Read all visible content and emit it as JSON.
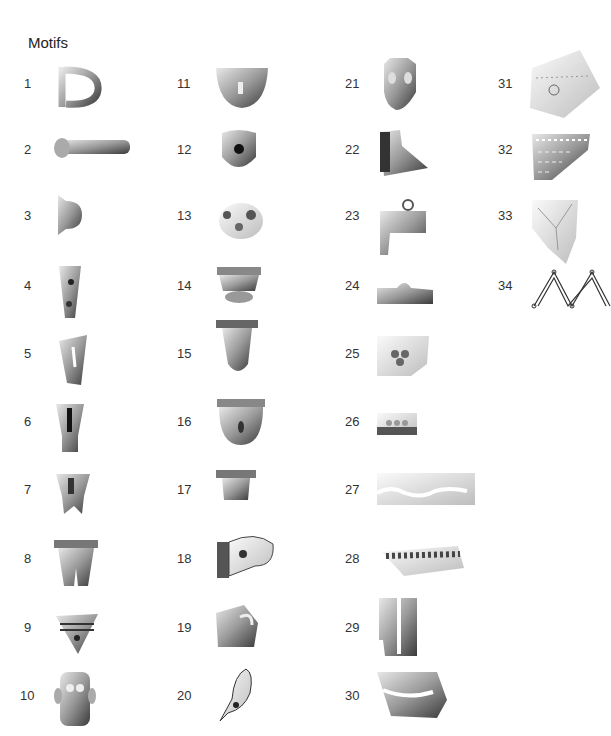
{
  "figure": {
    "title": "Motifs",
    "items": [
      {
        "n": "1",
        "x": 24,
        "y": 84,
        "ax": 52,
        "ay": 62,
        "aw": 50,
        "ah": 50,
        "shape": "handle-loop"
      },
      {
        "n": "2",
        "x": 24,
        "y": 150,
        "ax": 52,
        "ay": 134,
        "aw": 82,
        "ah": 28,
        "shape": "horizontal-bar"
      },
      {
        "n": "3",
        "x": 24,
        "y": 216,
        "ax": 52,
        "ay": 191,
        "aw": 32,
        "ah": 46,
        "shape": "knob"
      },
      {
        "n": "4",
        "x": 24,
        "y": 286,
        "ax": 55,
        "ay": 262,
        "aw": 30,
        "ah": 60,
        "shape": "tapered-leg"
      },
      {
        "n": "5",
        "x": 24,
        "y": 354,
        "ax": 55,
        "ay": 333,
        "aw": 34,
        "ah": 54,
        "shape": "tapered-leg-slit"
      },
      {
        "n": "6",
        "x": 24,
        "y": 422,
        "ax": 52,
        "ay": 400,
        "aw": 36,
        "ah": 55,
        "shape": "leg-groove"
      },
      {
        "n": "7",
        "x": 24,
        "y": 490,
        "ax": 52,
        "ay": 470,
        "aw": 42,
        "ah": 46,
        "shape": "molar-foot"
      },
      {
        "n": "8",
        "x": 24,
        "y": 559,
        "ax": 52,
        "ay": 538,
        "aw": 48,
        "ah": 52,
        "shape": "double-foot"
      },
      {
        "n": "9",
        "x": 24,
        "y": 628,
        "ax": 52,
        "ay": 608,
        "aw": 50,
        "ah": 50,
        "shape": "triangle-face"
      },
      {
        "n": "10",
        "x": 20,
        "y": 696,
        "ax": 52,
        "ay": 668,
        "aw": 46,
        "ah": 62,
        "shape": "mask-face"
      },
      {
        "n": "11",
        "x": 177,
        "y": 84,
        "ax": 214,
        "ay": 64,
        "aw": 56,
        "ah": 46,
        "shape": "bowl-face"
      },
      {
        "n": "12",
        "x": 177,
        "y": 150,
        "ax": 218,
        "ay": 127,
        "aw": 42,
        "ah": 46,
        "shape": "round-face-hole"
      },
      {
        "n": "13",
        "x": 177,
        "y": 216,
        "ax": 215,
        "ay": 197,
        "aw": 52,
        "ah": 44,
        "shape": "round-face-eyes"
      },
      {
        "n": "14",
        "x": 177,
        "y": 286,
        "ax": 215,
        "ay": 265,
        "aw": 48,
        "ah": 40,
        "shape": "cup-face"
      },
      {
        "n": "15",
        "x": 177,
        "y": 354,
        "ax": 216,
        "ay": 320,
        "aw": 42,
        "ah": 56,
        "shape": "tapered-pod"
      },
      {
        "n": "16",
        "x": 177,
        "y": 422,
        "ax": 215,
        "ay": 399,
        "aw": 52,
        "ah": 46,
        "shape": "bowl-hole"
      },
      {
        "n": "17",
        "x": 177,
        "y": 490,
        "ax": 216,
        "ay": 470,
        "aw": 40,
        "ah": 34,
        "shape": "small-cup"
      },
      {
        "n": "18",
        "x": 177,
        "y": 559,
        "ax": 215,
        "ay": 532,
        "aw": 62,
        "ah": 48,
        "shape": "animal-head"
      },
      {
        "n": "19",
        "x": 177,
        "y": 628,
        "ax": 214,
        "ay": 603,
        "aw": 46,
        "ah": 46,
        "shape": "fragment-loop"
      },
      {
        "n": "20",
        "x": 177,
        "y": 696,
        "ax": 214,
        "ay": 665,
        "aw": 40,
        "ah": 58,
        "shape": "bird-head"
      },
      {
        "n": "21",
        "x": 345,
        "y": 84,
        "ax": 376,
        "ay": 56,
        "aw": 46,
        "ah": 56,
        "shape": "animal-face"
      },
      {
        "n": "22",
        "x": 345,
        "y": 150,
        "ax": 376,
        "ay": 128,
        "aw": 52,
        "ah": 50,
        "shape": "beak-head"
      },
      {
        "n": "23",
        "x": 345,
        "y": 216,
        "ax": 376,
        "ay": 197,
        "aw": 52,
        "ah": 60,
        "shape": "jar-handle"
      },
      {
        "n": "24",
        "x": 345,
        "y": 286,
        "ax": 377,
        "ay": 278,
        "aw": 56,
        "ah": 26,
        "shape": "rim-knob"
      },
      {
        "n": "25",
        "x": 345,
        "y": 354,
        "ax": 377,
        "ay": 336,
        "aw": 52,
        "ah": 40,
        "shape": "rim-triple-dot"
      },
      {
        "n": "26",
        "x": 345,
        "y": 422,
        "ax": 377,
        "ay": 413,
        "aw": 40,
        "ah": 22,
        "shape": "rim-dots"
      },
      {
        "n": "27",
        "x": 345,
        "y": 490,
        "ax": 377,
        "ay": 473,
        "aw": 98,
        "ah": 32,
        "shape": "wavy-band"
      },
      {
        "n": "28",
        "x": 345,
        "y": 559,
        "ax": 380,
        "ay": 542,
        "aw": 84,
        "ah": 34,
        "shape": "rope-band"
      },
      {
        "n": "29",
        "x": 345,
        "y": 628,
        "ax": 377,
        "ay": 596,
        "aw": 42,
        "ah": 60,
        "shape": "vertical-ridge"
      },
      {
        "n": "30",
        "x": 345,
        "y": 696,
        "ax": 377,
        "ay": 670,
        "aw": 70,
        "ah": 50,
        "shape": "curved-band"
      },
      {
        "n": "31",
        "x": 498,
        "y": 84,
        "ax": 520,
        "ay": 48,
        "aw": 82,
        "ah": 72,
        "shape": "sherd-incised"
      },
      {
        "n": "32",
        "x": 498,
        "y": 150,
        "ax": 532,
        "ay": 132,
        "aw": 58,
        "ah": 50,
        "shape": "sherd-net"
      },
      {
        "n": "33",
        "x": 498,
        "y": 216,
        "ax": 532,
        "ay": 198,
        "aw": 48,
        "ah": 66,
        "shape": "sherd-lines"
      },
      {
        "n": "34",
        "x": 498,
        "y": 286,
        "ax": 530,
        "ay": 268,
        "aw": 81,
        "ah": 42,
        "shape": "zigzag-drawing"
      }
    ]
  }
}
